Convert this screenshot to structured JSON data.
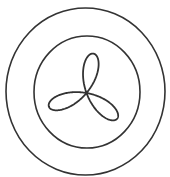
{
  "figure": {
    "stroke_color": "#333333",
    "background_color": "#ffffff",
    "outer_circle": {
      "cx": 85.5,
      "cy": 91.5,
      "rx": 79.5,
      "ry": 83.5,
      "stroke_width": 1.6
    },
    "inner_circle": {
      "cx": 87,
      "cy": 92,
      "rx": 53,
      "ry": 56,
      "stroke_width": 1.6
    },
    "flower": {
      "cx": 86.5,
      "cy": 93,
      "petals": 6,
      "petal_length": 40,
      "rotation_deg": -80,
      "stroke_width": 1.8
    }
  }
}
